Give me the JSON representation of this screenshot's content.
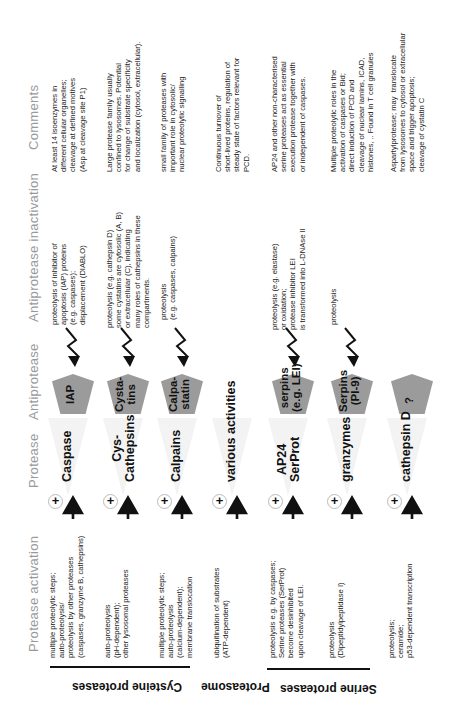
{
  "headings": {
    "comments": "Comments",
    "antiprotease_inactivation": "Antiprotease inactivation",
    "antiprotease": "Antiprotease",
    "protease": "Protease",
    "protease_activation": "Protease activation"
  },
  "rows": [
    {
      "protease": "Caspase",
      "antiprotease": "IAP",
      "activation": "multiple proteolytic steps;\nauto-proteolysis/\nproteolysis by other proteases\n(caspases, granzyme B, cathepsins)",
      "inactivation": "proteolysis of inhibitor of\napoptosis (IAP) proteins\n(e.g. caspases);\ndisplacement (DIABLO)",
      "comments": "At least 14 isoenzymes in\ndifferent cellular organelles;\ncleavage at defined motives\n(Asp at cleavage site P1)"
    },
    {
      "protease": "Cys-\nCathepsins",
      "antiprotease": "Cysta-\ntins",
      "activation": "auto-proteolysis\n(pH-dependent);\nother lysosomal proteases",
      "inactivation": "proteolysis (e.g. cathepsin D)\nsome cystatins are cytosolic (A, B)\nor extracellular (C), indicating\nmany roles of cathepsins in these\ncompartments.",
      "comments": "Large protease family usually\nconfined to lysosomes. Potential\nfor change of substrate specificity\nand localization (cytosol, extracellular)."
    },
    {
      "protease": "Calpains",
      "antiprotease": "Calpa-\nstatin",
      "activation": "multiple proteolytic steps;\nauto-proteolysis\n(calcium-dependent);\nmembrane translocation",
      "inactivation": "proteolysis\n(e.g. caspases, calpains)",
      "comments": "small family of proteases with\nimportant role in cytosolic/\nnuclear proteolytic signalling"
    },
    {
      "protease": "various activities",
      "antiprotease": "",
      "activation": "ubiquitination of substrates\n(ATP-dependent)",
      "inactivation": "",
      "comments": "Continuous turnover of\nshort-lived proteins, regulation of\nsteady state of factors relevant for\nPCD."
    },
    {
      "protease": "AP24\nSerProt",
      "antiprotease": "serpins\n(e.g. LEI)",
      "activation": "proteolysis e.g. by caspases;\nSerine proteases (SerProt)\nbecome desinhibited\nupon cleavage of LEI.",
      "inactivation": "proteolysis (e.g. elastase)\nor oxidation;\nprotease inhibitor LEI\nis transformed into L-DNAse II",
      "comments": "AP24 and other non-characterised\nserine proteases act as essential\nexecution protease together with\nor independent of caspases."
    },
    {
      "protease": "granzymes",
      "antiprotease": "Serpins\n(PI-9)",
      "activation": "proteolysis\n(Dipeptidylpeptidase I)",
      "inactivation": "proteolysis",
      "comments": "Multiple proteolytic roles in the\nactivation of caspases or Bid;\ndirect induction of PCD and\ncleavage of nuclear lamins, ICAD,\nhistones, .. Found in T cell granules"
    },
    {
      "protease": "cathepsin D",
      "antiprotease": "?",
      "activation": "proteolysis;\nceramide;\np53-dependent transcription",
      "inactivation": "",
      "comments": "Aspartylprotease; may  translocate\nfrom lysosomes to cytosol or extracellular\nspace and trigger apoptosis;\ncleavage of cystatin C"
    }
  ],
  "groups": [
    {
      "label": "Cysteine proteases"
    },
    {
      "label": "Proteasome"
    },
    {
      "label": "Serine proteases"
    }
  ],
  "icons": {
    "activation_symbol": "plus-in-circle",
    "protease_symbol": "black-arrow-triangle",
    "antiprotease_symbol": "grey-pentagon",
    "inactivation_symbol": "lightning-bolt-arrow"
  }
}
